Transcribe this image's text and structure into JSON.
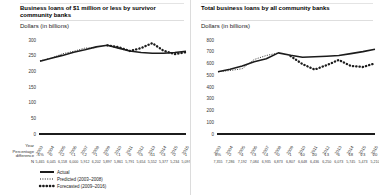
{
  "figure": {
    "legend": {
      "actual": "Actual",
      "predicted": "Predicted (2003–2008)",
      "forecasted": "Forecasted (2009–2016)"
    },
    "row_labels": {
      "year": "Year",
      "pct_line1": "Percentage",
      "pct_line2": "difference",
      "n": "N"
    }
  },
  "colors": {
    "line": "#1c1c1c",
    "text": "#333333",
    "divider": "#dcdcdc"
  },
  "chart_data": [
    {
      "type": "line",
      "title": "Business loans of $1 million or less by survivor community banks",
      "unit_label": "Dollars (in billions)",
      "x_years": [
        "2003",
        "2004",
        "2005",
        "2006",
        "2007",
        "2008",
        "2009",
        "2010",
        "2011",
        "2012",
        "2013",
        "2014",
        "2015",
        "2016"
      ],
      "ylim": [
        0,
        300
      ],
      "ytick_step": 50,
      "grid": false,
      "legend_position": "bottom-left",
      "series": [
        {
          "name": "Actual",
          "style": "solid",
          "values": [
            232,
            242,
            251,
            261,
            269,
            278,
            283,
            274,
            265,
            260,
            258,
            258,
            260,
            264
          ]
        },
        {
          "name": "Predicted (2003–2008)",
          "style": "dotted-fine",
          "values": [
            234,
            242,
            256,
            264,
            274,
            275,
            null,
            null,
            null,
            null,
            null,
            null,
            null,
            null
          ]
        },
        {
          "name": "Forecasted (2009–2016)",
          "style": "dotted-bold",
          "values": [
            null,
            null,
            null,
            null,
            null,
            null,
            283,
            277,
            265,
            274,
            290,
            266,
            255,
            261
          ]
        }
      ],
      "pct_diff": [
        "-1%",
        "0",
        "-2",
        "-1",
        "-2",
        "1",
        "0",
        "-1",
        "0",
        "-5",
        "-11",
        "-3",
        "2",
        "1"
      ],
      "n_row": [
        "5,465",
        "6,045",
        "6,158",
        "6,000",
        "5,912",
        "6,202",
        "5,897",
        "5,861",
        "5,791",
        "5,654",
        "5,552",
        "5,377",
        "5,234",
        "5,097"
      ]
    },
    {
      "type": "line",
      "title": "Total business loans by all community banks",
      "unit_label": "Dollars (in billions)",
      "x_years": [
        "2003",
        "2004",
        "2005",
        "2006",
        "2007",
        "2008",
        "2009",
        "2010",
        "2011",
        "2012",
        "2013",
        "2014",
        "2015",
        "2016"
      ],
      "ylim": [
        0,
        800
      ],
      "ytick_step": 100,
      "grid": false,
      "legend_position": "none",
      "series": [
        {
          "name": "Actual",
          "style": "solid",
          "values": [
            530,
            551,
            578,
            615,
            641,
            690,
            671,
            654,
            658,
            662,
            668,
            684,
            701,
            722
          ]
        },
        {
          "name": "Predicted (2003–2008)",
          "style": "dotted-fine",
          "values": [
            530,
            540,
            556,
            634,
            668,
            690,
            null,
            null,
            null,
            null,
            null,
            null,
            null,
            null
          ]
        },
        {
          "name": "Forecasted (2009–2016)",
          "style": "dotted-bold",
          "values": [
            null,
            null,
            null,
            null,
            null,
            null,
            664,
            595,
            548,
            586,
            630,
            580,
            570,
            602
          ]
        }
      ],
      "pct_diff": [
        "0%",
        "2",
        "4",
        "-3",
        "-4",
        "0",
        "1",
        "10",
        "20",
        "13",
        "6",
        "18",
        "23",
        "20"
      ],
      "n_row": [
        "7,355",
        "7,286",
        "7,192",
        "7,084",
        "6,935",
        "6,873",
        "6,807",
        "6,648",
        "6,436",
        "6,250",
        "6,073",
        "5,745",
        "5,473",
        "5,210"
      ]
    }
  ]
}
